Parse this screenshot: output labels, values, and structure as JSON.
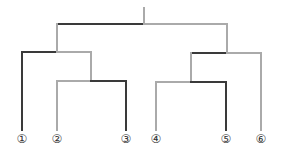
{
  "diagram": {
    "type": "dendrogram",
    "colors": {
      "dark": "#3a3a3a",
      "light": "#aaaaaa"
    },
    "leaves": [
      {
        "id": 1,
        "label": "①",
        "x": 22
      },
      {
        "id": 2,
        "label": "②",
        "x": 57
      },
      {
        "id": 3,
        "label": "③",
        "x": 126
      },
      {
        "id": 4,
        "label": "④",
        "x": 156
      },
      {
        "id": 5,
        "label": "⑤",
        "x": 226
      },
      {
        "id": 6,
        "label": "⑥",
        "x": 261
      }
    ],
    "clusters": [
      {
        "name": "root",
        "children": [
          "left-cluster",
          "right-cluster"
        ]
      },
      {
        "name": "left-cluster",
        "children": [
          "1",
          "left-sub"
        ]
      },
      {
        "name": "left-sub",
        "children": [
          "2",
          "3"
        ]
      },
      {
        "name": "right-cluster",
        "children": [
          "right-sub",
          "6"
        ]
      },
      {
        "name": "right-sub",
        "children": [
          "4",
          "5"
        ]
      }
    ]
  }
}
